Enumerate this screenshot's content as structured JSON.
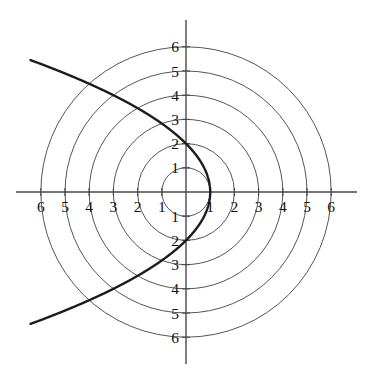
{
  "figure": {
    "kind": "polar-grid-conic-plot",
    "background_color": "#ffffff",
    "grid_color": "#555555",
    "axis_color": "#4a4a4a",
    "curve_color": "#1c1c1c"
  },
  "chart_data": {
    "type": "line",
    "title": "",
    "subtitle": "",
    "xlabel": "",
    "ylabel": "",
    "grid": true,
    "grid_style": "polar concentric circles",
    "legend": "none",
    "coordinate_system": "polar",
    "xlim": [
      -6.6,
      6.6
    ],
    "ylim": [
      -6.6,
      6.6
    ],
    "x_tick_labels": [
      "6",
      "5",
      "4",
      "3",
      "2",
      "1",
      "1",
      "2",
      "3",
      "4",
      "5",
      "6"
    ],
    "x_tick_values": [
      -6,
      -5,
      -4,
      -3,
      -2,
      -1,
      1,
      2,
      3,
      4,
      5,
      6
    ],
    "y_tick_labels": [
      "6",
      "5",
      "4",
      "3",
      "2",
      "1",
      "1",
      "2",
      "3",
      "4",
      "5",
      "6"
    ],
    "y_tick_values": [
      6,
      5,
      4,
      3,
      2,
      1,
      -1,
      -2,
      -3,
      -4,
      -5,
      -6
    ],
    "polar_grid_radii": [
      1,
      2,
      3,
      4,
      5,
      6
    ],
    "series": [
      {
        "name": "r = 2/(1 + cos(theta))",
        "equation": "r = 2/(1 + cos θ)",
        "curve_type": "parabola",
        "eccentricity": 1,
        "semi_latus_rectum": 2,
        "vertex": [
          1,
          0
        ],
        "y_intercepts": [
          [
            0,
            2
          ],
          [
            0,
            -2
          ]
        ],
        "cartesian_form": "y^2 = 4 - 4x",
        "x": [
          1,
          0.96,
          0.84,
          0.64,
          0.36,
          0,
          -0.44,
          -0.96,
          -1.56,
          -2.24,
          -3,
          -3.84,
          -4.76,
          -5.76,
          -6.0
        ],
        "y": [
          0,
          0.4,
          0.8,
          1.2,
          1.6,
          2.0,
          2.4,
          2.8,
          3.2,
          3.6,
          4.0,
          4.4,
          4.8,
          5.2,
          5.29
        ],
        "mirrored_lower_branch": true
      }
    ],
    "annotations": []
  },
  "geometry": {
    "origin_px": [
      186,
      192
    ],
    "unit_px": 24.2,
    "axis_x_extent_px": [
      16,
      357
    ],
    "axis_y_extent_px": [
      20,
      364
    ],
    "curve_endpoint_upper_px": [
      25,
      70
    ],
    "curve_endpoint_lower_px": [
      27,
      312
    ]
  }
}
